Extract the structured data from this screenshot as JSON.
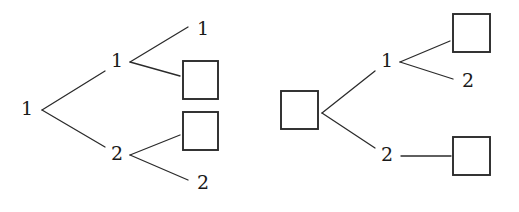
{
  "figure": {
    "title": "",
    "background_color": "#ffffff",
    "line_color": "#2b2b2b",
    "text_color": "#1a1a1a",
    "box_fill": "#ffffff"
  },
  "chart_data": {
    "type": "diagram",
    "subtype": "binary-tree-pair",
    "title": "",
    "xlabel": "",
    "ylabel": "",
    "grid": false,
    "legend": null,
    "trees": [
      {
        "name": "left-tree",
        "root": {
          "id": "L-root",
          "label": "1",
          "shape": "text",
          "x": 27,
          "y": 110
        },
        "nodes": [
          {
            "id": "L-n1",
            "label": "1",
            "shape": "text",
            "x": 117,
            "y": 62
          },
          {
            "id": "L-n2",
            "label": "2",
            "shape": "text",
            "x": 117,
            "y": 155
          },
          {
            "id": "L-leaf1",
            "label": "1",
            "shape": "text",
            "x": 203,
            "y": 30
          },
          {
            "id": "L-leaf2",
            "label": "",
            "shape": "square",
            "x": 183,
            "y": 61,
            "width": 35,
            "height": 38
          },
          {
            "id": "L-leaf3",
            "label": "",
            "shape": "square",
            "x": 183,
            "y": 112,
            "width": 35,
            "height": 38
          },
          {
            "id": "L-leaf4",
            "label": "2",
            "shape": "text",
            "x": 203,
            "y": 184
          }
        ],
        "edges": [
          {
            "from": "L-root",
            "to": "L-n1",
            "x1": 42,
            "y1": 110,
            "x2": 105,
            "y2": 71
          },
          {
            "from": "L-root",
            "to": "L-n2",
            "x1": 42,
            "y1": 110,
            "x2": 105,
            "y2": 147
          },
          {
            "from": "L-n1",
            "to": "L-leaf1",
            "x1": 130,
            "y1": 62,
            "x2": 188,
            "y2": 27
          },
          {
            "from": "L-n1",
            "to": "L-leaf2",
            "x1": 130,
            "y1": 62,
            "x2": 180,
            "y2": 76
          },
          {
            "from": "L-n2",
            "to": "L-leaf3",
            "x1": 130,
            "y1": 155,
            "x2": 180,
            "y2": 135
          },
          {
            "from": "L-n2",
            "to": "L-leaf4",
            "x1": 130,
            "y1": 155,
            "x2": 188,
            "y2": 180
          }
        ]
      },
      {
        "name": "right-tree",
        "root": {
          "id": "R-root",
          "label": "",
          "shape": "square",
          "x": 281,
          "y": 91,
          "width": 37,
          "height": 38
        },
        "nodes": [
          {
            "id": "R-n1",
            "label": "1",
            "shape": "text",
            "x": 387,
            "y": 62
          },
          {
            "id": "R-n2",
            "label": "2",
            "shape": "text",
            "x": 387,
            "y": 156
          },
          {
            "id": "R-leaf1",
            "label": "",
            "shape": "square",
            "x": 453,
            "y": 14,
            "width": 37,
            "height": 38
          },
          {
            "id": "R-leaf2",
            "label": "2",
            "shape": "text",
            "x": 468,
            "y": 82
          },
          {
            "id": "R-leaf3",
            "label": "",
            "shape": "square",
            "x": 453,
            "y": 137,
            "width": 37,
            "height": 38
          }
        ],
        "edges": [
          {
            "from": "R-root",
            "to": "R-n1",
            "x1": 322,
            "y1": 113,
            "x2": 375,
            "y2": 71
          },
          {
            "from": "R-root",
            "to": "R-n2",
            "x1": 322,
            "y1": 113,
            "x2": 375,
            "y2": 148
          },
          {
            "from": "R-n1",
            "to": "R-leaf1",
            "x1": 400,
            "y1": 62,
            "x2": 450,
            "y2": 41
          },
          {
            "from": "R-n1",
            "to": "R-leaf2",
            "x1": 400,
            "y1": 62,
            "x2": 453,
            "y2": 79
          },
          {
            "from": "R-n2",
            "to": "R-leaf3",
            "x1": 401,
            "y1": 156,
            "x2": 451,
            "y2": 156
          }
        ]
      }
    ]
  }
}
